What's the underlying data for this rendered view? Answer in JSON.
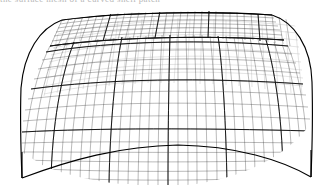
{
  "figure": {
    "title_fragment": "the  surface  mesh  of  a  curved  shell  patch",
    "background_color": "#ffffff",
    "line_color": "#2b2b2b",
    "patch_line_color": "#111111",
    "silhouette_color": "#000000",
    "rendering": "wireframe",
    "object_name": "curved-surface-mesh"
  },
  "mesh": {
    "u_divisions": 60,
    "v_divisions": 26,
    "patch_columns": 6,
    "patch_rows": 3,
    "shading": "none"
  },
  "geometry": {
    "ridge_left_x": 55,
    "ridge_left_y": 30,
    "ridge_right_x": 300,
    "ridge_right_y": 22,
    "crest_y": 12,
    "skirt_bottom_y": 182,
    "left_edge_x": 20,
    "right_edge_x": 312,
    "arc_sag": 52
  }
}
